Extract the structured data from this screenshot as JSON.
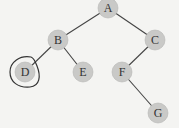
{
  "diagram": {
    "type": "binary-tree",
    "nodes": [
      {
        "id": "A",
        "label": "A",
        "x": 108,
        "y": 8
      },
      {
        "id": "B",
        "label": "B",
        "x": 58,
        "y": 40
      },
      {
        "id": "C",
        "label": "C",
        "x": 155,
        "y": 40
      },
      {
        "id": "D",
        "label": "D",
        "x": 25,
        "y": 72
      },
      {
        "id": "E",
        "label": "E",
        "x": 83,
        "y": 72
      },
      {
        "id": "F",
        "label": "F",
        "x": 122,
        "y": 72
      },
      {
        "id": "G",
        "label": "G",
        "x": 158,
        "y": 113
      }
    ],
    "edges": [
      [
        "A",
        "B"
      ],
      [
        "A",
        "C"
      ],
      [
        "B",
        "D"
      ],
      [
        "B",
        "E"
      ],
      [
        "C",
        "F"
      ],
      [
        "F",
        "G"
      ]
    ],
    "highlighted": "D",
    "colors": {
      "node_fill": "#c9c9c7",
      "edge": "#444444",
      "highlight": "#333333"
    }
  }
}
